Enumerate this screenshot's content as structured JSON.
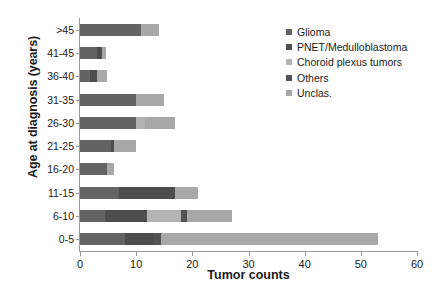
{
  "chart_data": {
    "type": "bar",
    "orientation": "horizontal",
    "stacked": true,
    "title": "",
    "xlabel": "Tumor counts",
    "ylabel": "Age at diagnosis (years)",
    "xlim": [
      0,
      60
    ],
    "xticks": [
      0,
      10,
      20,
      30,
      40,
      50,
      60
    ],
    "grid": false,
    "legend_position": "top-right",
    "categories": [
      "0-5",
      "6-10",
      "11-15",
      "16-20",
      "21-25",
      "26-30",
      "31-35",
      "36-40",
      "41-45",
      ">45"
    ],
    "categories_top_to_bottom": [
      ">45",
      "41-45",
      "36-40",
      "31-35",
      "26-30",
      "21-25",
      "16-20",
      "11-15",
      "6-10",
      "0-5"
    ],
    "series": [
      {
        "name": "Glioma",
        "color": "#636363",
        "values": [
          8,
          4.5,
          7,
          4.8,
          5.5,
          10,
          10,
          1.8,
          3,
          10.9
        ]
      },
      {
        "name": "PNET/Medulloblastoma",
        "color": "#4d4d4d",
        "values": [
          5,
          7.5,
          10,
          0,
          0.5,
          0,
          0,
          1.2,
          1,
          0
        ]
      },
      {
        "name": "Choroid plexus tumors",
        "color": "#b3b3b3",
        "values": [
          0,
          6,
          0,
          0,
          0,
          1.5,
          0,
          0,
          0,
          0
        ]
      },
      {
        "name": "Others",
        "color": "#525252",
        "values": [
          1.5,
          1,
          0,
          0,
          0,
          0,
          0,
          0,
          0,
          0
        ]
      },
      {
        "name": "Unclas.",
        "color": "#a8a8a8",
        "values": [
          38.5,
          8,
          4,
          1.2,
          4,
          5.5,
          5,
          1.8,
          0.7,
          3.1
        ]
      }
    ],
    "totals": [
      53,
      27,
      21,
      6,
      10,
      17,
      15,
      4.8,
      4.7,
      14
    ]
  },
  "axes": {
    "x": {
      "title": "Tumor counts",
      "tick_labels": [
        "0",
        "10",
        "20",
        "30",
        "40",
        "50",
        "60"
      ]
    },
    "y": {
      "title": "Age at diagnosis (years)",
      "tick_labels": [
        ">45",
        "41-45",
        "36-40",
        "31-35",
        "26-30",
        "21-25",
        "16-20",
        "11-15",
        "6-10",
        "0-5"
      ]
    }
  },
  "legend": {
    "items": [
      {
        "label": "Glioma",
        "color": "#636363"
      },
      {
        "label": "PNET/Medulloblastoma",
        "color": "#4d4d4d"
      },
      {
        "label": "Choroid plexus tumors",
        "color": "#b3b3b3"
      },
      {
        "label": "Others",
        "color": "#525252"
      },
      {
        "label": "Unclas.",
        "color": "#a8a8a8"
      }
    ]
  }
}
